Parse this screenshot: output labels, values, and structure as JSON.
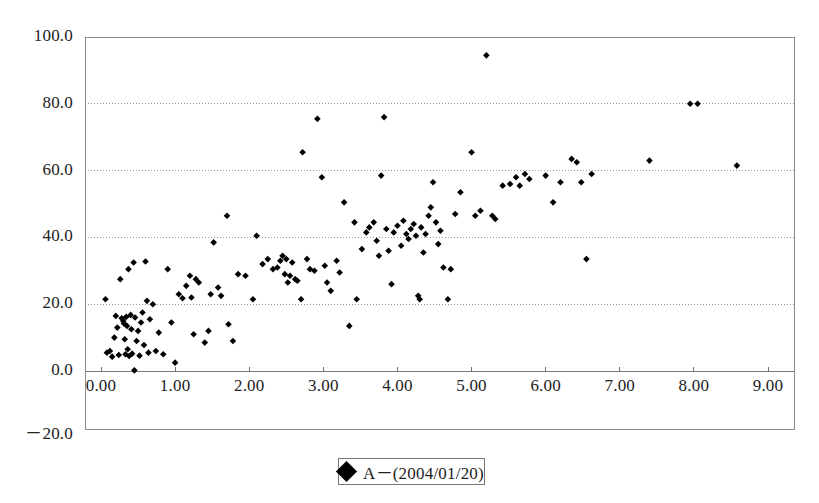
{
  "chart_data": {
    "type": "scatter",
    "title": "",
    "xlabel": "",
    "ylabel": "",
    "xlim": [
      -0.35,
      9.35
    ],
    "ylim": [
      -20.0,
      100.0
    ],
    "xticks": [
      0.0,
      1.0,
      2.0,
      3.0,
      4.0,
      5.0,
      6.0,
      7.0,
      8.0,
      9.0
    ],
    "xtick_labels": [
      "0.00",
      "1.00",
      "2.00",
      "3.00",
      "4.00",
      "5.00",
      "6.00",
      "7.00",
      "8.00",
      "9.00"
    ],
    "yticks": [
      -20.0,
      0.0,
      20.0,
      40.0,
      60.0,
      80.0,
      100.0
    ],
    "ytick_labels": [
      "－20.0",
      "0.0",
      "20.0",
      "40.0",
      "60.0",
      "80.0",
      "100.0"
    ],
    "grid": true,
    "grid_axis": "y",
    "grid_style": "dotted",
    "legend_position": "bottom-center",
    "marker": "diamond",
    "marker_color": "#000000",
    "series": [
      {
        "name": "A－(2004/01/20)",
        "points": [
          [
            0.06,
            21.5
          ],
          [
            0.08,
            5.5
          ],
          [
            0.12,
            6.0
          ],
          [
            0.15,
            4.3
          ],
          [
            0.18,
            10.0
          ],
          [
            0.2,
            16.5
          ],
          [
            0.22,
            13.0
          ],
          [
            0.24,
            4.8
          ],
          [
            0.26,
            27.5
          ],
          [
            0.28,
            15.8
          ],
          [
            0.3,
            15.0
          ],
          [
            0.31,
            14.2
          ],
          [
            0.32,
            9.5
          ],
          [
            0.33,
            5.0
          ],
          [
            0.34,
            16.2
          ],
          [
            0.35,
            13.5
          ],
          [
            0.36,
            6.5
          ],
          [
            0.37,
            30.5
          ],
          [
            0.38,
            4.5
          ],
          [
            0.4,
            16.8
          ],
          [
            0.41,
            12.5
          ],
          [
            0.42,
            5.2
          ],
          [
            0.44,
            32.5
          ],
          [
            0.45,
            0.2
          ],
          [
            0.46,
            16.0
          ],
          [
            0.48,
            9.0
          ],
          [
            0.5,
            12.0
          ],
          [
            0.52,
            4.6
          ],
          [
            0.54,
            14.5
          ],
          [
            0.56,
            17.5
          ],
          [
            0.58,
            7.8
          ],
          [
            0.6,
            32.8
          ],
          [
            0.62,
            21.0
          ],
          [
            0.64,
            5.5
          ],
          [
            0.66,
            15.5
          ],
          [
            0.7,
            20.0
          ],
          [
            0.74,
            6.0
          ],
          [
            0.78,
            11.5
          ],
          [
            0.84,
            5.0
          ],
          [
            0.9,
            30.5
          ],
          [
            0.95,
            14.5
          ],
          [
            1.0,
            2.5
          ],
          [
            1.05,
            23.0
          ],
          [
            1.1,
            21.8
          ],
          [
            1.15,
            25.5
          ],
          [
            1.2,
            28.5
          ],
          [
            1.22,
            22.0
          ],
          [
            1.25,
            11.0
          ],
          [
            1.28,
            27.5
          ],
          [
            1.32,
            26.5
          ],
          [
            1.4,
            8.5
          ],
          [
            1.45,
            12.0
          ],
          [
            1.48,
            23.0
          ],
          [
            1.52,
            38.5
          ],
          [
            1.58,
            25.0
          ],
          [
            1.62,
            22.5
          ],
          [
            1.7,
            46.5
          ],
          [
            1.72,
            14.0
          ],
          [
            1.78,
            9.0
          ],
          [
            1.85,
            29.0
          ],
          [
            1.95,
            28.5
          ],
          [
            2.05,
            21.5
          ],
          [
            2.1,
            40.5
          ],
          [
            2.18,
            32.0
          ],
          [
            2.25,
            33.5
          ],
          [
            2.32,
            30.5
          ],
          [
            2.38,
            31.0
          ],
          [
            2.42,
            33.0
          ],
          [
            2.45,
            34.5
          ],
          [
            2.48,
            29.0
          ],
          [
            2.5,
            33.5
          ],
          [
            2.52,
            26.5
          ],
          [
            2.55,
            28.5
          ],
          [
            2.58,
            32.5
          ],
          [
            2.62,
            27.5
          ],
          [
            2.65,
            27.0
          ],
          [
            2.7,
            21.5
          ],
          [
            2.72,
            65.5
          ],
          [
            2.78,
            33.5
          ],
          [
            2.82,
            30.5
          ],
          [
            2.88,
            30.0
          ],
          [
            2.92,
            75.5
          ],
          [
            2.98,
            58.0
          ],
          [
            3.02,
            31.5
          ],
          [
            3.05,
            26.5
          ],
          [
            3.1,
            24.0
          ],
          [
            3.18,
            33.0
          ],
          [
            3.22,
            29.5
          ],
          [
            3.28,
            50.5
          ],
          [
            3.35,
            13.5
          ],
          [
            3.42,
            44.5
          ],
          [
            3.45,
            21.5
          ],
          [
            3.52,
            36.5
          ],
          [
            3.58,
            41.5
          ],
          [
            3.62,
            43.0
          ],
          [
            3.68,
            44.5
          ],
          [
            3.72,
            39.0
          ],
          [
            3.75,
            34.5
          ],
          [
            3.78,
            58.5
          ],
          [
            3.82,
            76.0
          ],
          [
            3.85,
            42.5
          ],
          [
            3.88,
            36.0
          ],
          [
            3.92,
            26.0
          ],
          [
            3.95,
            41.5
          ],
          [
            4.0,
            43.5
          ],
          [
            4.05,
            37.5
          ],
          [
            4.08,
            45.0
          ],
          [
            4.12,
            41.0
          ],
          [
            4.15,
            39.5
          ],
          [
            4.18,
            42.5
          ],
          [
            4.22,
            44.0
          ],
          [
            4.25,
            40.5
          ],
          [
            4.28,
            22.5
          ],
          [
            4.3,
            21.5
          ],
          [
            4.32,
            43.0
          ],
          [
            4.35,
            35.5
          ],
          [
            4.38,
            41.0
          ],
          [
            4.42,
            46.5
          ],
          [
            4.45,
            49.0
          ],
          [
            4.48,
            56.5
          ],
          [
            4.52,
            44.5
          ],
          [
            4.55,
            38.0
          ],
          [
            4.58,
            42.0
          ],
          [
            4.62,
            31.0
          ],
          [
            4.68,
            21.5
          ],
          [
            4.72,
            30.5
          ],
          [
            4.78,
            47.0
          ],
          [
            4.85,
            53.5
          ],
          [
            5.0,
            65.5
          ],
          [
            5.05,
            46.5
          ],
          [
            5.12,
            48.0
          ],
          [
            5.2,
            94.5
          ],
          [
            5.28,
            46.5
          ],
          [
            5.32,
            45.5
          ],
          [
            5.42,
            55.5
          ],
          [
            5.52,
            56.0
          ],
          [
            5.6,
            58.0
          ],
          [
            5.65,
            55.5
          ],
          [
            5.72,
            59.0
          ],
          [
            5.78,
            57.5
          ],
          [
            6.0,
            58.5
          ],
          [
            6.1,
            50.5
          ],
          [
            6.2,
            56.5
          ],
          [
            6.35,
            63.5
          ],
          [
            6.42,
            62.5
          ],
          [
            6.48,
            56.5
          ],
          [
            6.55,
            33.5
          ],
          [
            6.62,
            59.0
          ],
          [
            7.4,
            63.0
          ],
          [
            7.95,
            80.0
          ],
          [
            8.05,
            80.0
          ],
          [
            8.58,
            61.5
          ]
        ]
      }
    ]
  },
  "legend": {
    "label": "A－(2004/01/20)",
    "marker_name": "diamond-marker"
  }
}
